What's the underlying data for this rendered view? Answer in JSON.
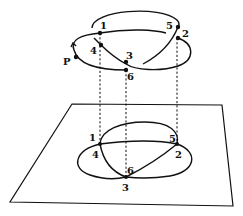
{
  "diagram": {
    "knot_points": [
      {
        "id": "P",
        "label": "P"
      },
      {
        "id": "1",
        "label": "1"
      },
      {
        "id": "2",
        "label": "2"
      },
      {
        "id": "3",
        "label": "3"
      },
      {
        "id": "4",
        "label": "4"
      },
      {
        "id": "5",
        "label": "5"
      },
      {
        "id": "6",
        "label": "6"
      }
    ],
    "projection_labels": [
      {
        "id": "1",
        "label": "1"
      },
      {
        "id": "4",
        "label": "4"
      },
      {
        "id": "5",
        "label": "5"
      },
      {
        "id": "2",
        "label": "2"
      },
      {
        "id": "6",
        "label": "6"
      },
      {
        "id": "3",
        "label": "3"
      }
    ],
    "projection_lines": [
      "1-4",
      "3-6",
      "5-2"
    ],
    "colors": {
      "stroke": "#111111",
      "background": "#ffffff"
    }
  }
}
